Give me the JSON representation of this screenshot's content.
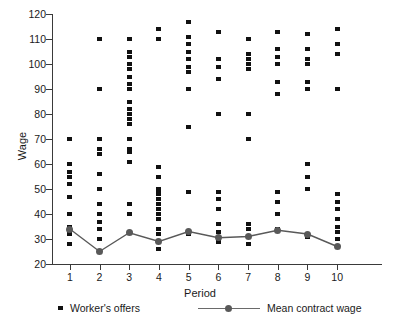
{
  "chart_data": {
    "type": "scatter",
    "title": "",
    "xlabel": "Period",
    "ylabel": "Wage",
    "xlim": [
      0.4,
      10.6
    ],
    "ylim": [
      20,
      120
    ],
    "grid": false,
    "x_ticks": [
      1,
      2,
      3,
      4,
      5,
      6,
      7,
      8,
      9,
      10
    ],
    "x_tick_labels": [
      "1",
      "2",
      "3",
      "4",
      "5",
      "6",
      "7",
      "8",
      "9",
      "10"
    ],
    "y_ticks": [
      20,
      30,
      40,
      50,
      60,
      70,
      80,
      90,
      100,
      110,
      120
    ],
    "y_tick_labels": [
      "20",
      "30",
      "40",
      "50",
      "60",
      "70",
      "80",
      "90",
      "100",
      "110",
      "120"
    ],
    "legend_position": "below",
    "series": [
      {
        "name": "Worker's offers",
        "type": "scatter",
        "marker": "square",
        "color": "#111111",
        "points": [
          {
            "x": 1,
            "y": 70
          },
          {
            "x": 1,
            "y": 60
          },
          {
            "x": 1,
            "y": 57
          },
          {
            "x": 1,
            "y": 55
          },
          {
            "x": 1,
            "y": 52
          },
          {
            "x": 1,
            "y": 47
          },
          {
            "x": 1,
            "y": 40
          },
          {
            "x": 1,
            "y": 35
          },
          {
            "x": 1,
            "y": 33
          },
          {
            "x": 1,
            "y": 32
          },
          {
            "x": 1,
            "y": 28
          },
          {
            "x": 2,
            "y": 110
          },
          {
            "x": 2,
            "y": 90
          },
          {
            "x": 2,
            "y": 70
          },
          {
            "x": 2,
            "y": 66
          },
          {
            "x": 2,
            "y": 64
          },
          {
            "x": 2,
            "y": 56
          },
          {
            "x": 2,
            "y": 50
          },
          {
            "x": 2,
            "y": 44
          },
          {
            "x": 2,
            "y": 40
          },
          {
            "x": 2,
            "y": 37
          },
          {
            "x": 2,
            "y": 34
          },
          {
            "x": 2,
            "y": 30
          },
          {
            "x": 2,
            "y": 25
          },
          {
            "x": 3,
            "y": 110
          },
          {
            "x": 3,
            "y": 105
          },
          {
            "x": 3,
            "y": 103
          },
          {
            "x": 3,
            "y": 100
          },
          {
            "x": 3,
            "y": 98
          },
          {
            "x": 3,
            "y": 95
          },
          {
            "x": 3,
            "y": 92
          },
          {
            "x": 3,
            "y": 90
          },
          {
            "x": 3,
            "y": 85
          },
          {
            "x": 3,
            "y": 82
          },
          {
            "x": 3,
            "y": 80
          },
          {
            "x": 3,
            "y": 78
          },
          {
            "x": 3,
            "y": 76
          },
          {
            "x": 3,
            "y": 70
          },
          {
            "x": 3,
            "y": 66
          },
          {
            "x": 3,
            "y": 65
          },
          {
            "x": 3,
            "y": 61
          },
          {
            "x": 3,
            "y": 44
          },
          {
            "x": 3,
            "y": 40
          },
          {
            "x": 3,
            "y": 33
          },
          {
            "x": 4,
            "y": 114
          },
          {
            "x": 4,
            "y": 110
          },
          {
            "x": 4,
            "y": 59
          },
          {
            "x": 4,
            "y": 55
          },
          {
            "x": 4,
            "y": 50
          },
          {
            "x": 4,
            "y": 49
          },
          {
            "x": 4,
            "y": 48
          },
          {
            "x": 4,
            "y": 46
          },
          {
            "x": 4,
            "y": 44
          },
          {
            "x": 4,
            "y": 42
          },
          {
            "x": 4,
            "y": 40
          },
          {
            "x": 4,
            "y": 38
          },
          {
            "x": 4,
            "y": 34
          },
          {
            "x": 4,
            "y": 32
          },
          {
            "x": 4,
            "y": 29
          },
          {
            "x": 4,
            "y": 26
          },
          {
            "x": 5,
            "y": 117
          },
          {
            "x": 5,
            "y": 111
          },
          {
            "x": 5,
            "y": 108
          },
          {
            "x": 5,
            "y": 105
          },
          {
            "x": 5,
            "y": 102
          },
          {
            "x": 5,
            "y": 99
          },
          {
            "x": 5,
            "y": 97
          },
          {
            "x": 5,
            "y": 90
          },
          {
            "x": 5,
            "y": 75
          },
          {
            "x": 5,
            "y": 49
          },
          {
            "x": 5,
            "y": 32
          },
          {
            "x": 6,
            "y": 113
          },
          {
            "x": 6,
            "y": 102
          },
          {
            "x": 6,
            "y": 99
          },
          {
            "x": 6,
            "y": 94
          },
          {
            "x": 6,
            "y": 80
          },
          {
            "x": 6,
            "y": 49
          },
          {
            "x": 6,
            "y": 46
          },
          {
            "x": 6,
            "y": 42
          },
          {
            "x": 6,
            "y": 36
          },
          {
            "x": 6,
            "y": 33
          },
          {
            "x": 6,
            "y": 29
          },
          {
            "x": 7,
            "y": 110
          },
          {
            "x": 7,
            "y": 104
          },
          {
            "x": 7,
            "y": 102
          },
          {
            "x": 7,
            "y": 100
          },
          {
            "x": 7,
            "y": 98
          },
          {
            "x": 7,
            "y": 80
          },
          {
            "x": 7,
            "y": 70
          },
          {
            "x": 7,
            "y": 36
          },
          {
            "x": 7,
            "y": 34
          },
          {
            "x": 7,
            "y": 31
          },
          {
            "x": 7,
            "y": 28
          },
          {
            "x": 8,
            "y": 113
          },
          {
            "x": 8,
            "y": 106
          },
          {
            "x": 8,
            "y": 103
          },
          {
            "x": 8,
            "y": 100
          },
          {
            "x": 8,
            "y": 93
          },
          {
            "x": 8,
            "y": 88
          },
          {
            "x": 8,
            "y": 49
          },
          {
            "x": 8,
            "y": 45
          },
          {
            "x": 8,
            "y": 40
          },
          {
            "x": 8,
            "y": 34
          },
          {
            "x": 9,
            "y": 112
          },
          {
            "x": 9,
            "y": 106
          },
          {
            "x": 9,
            "y": 102
          },
          {
            "x": 9,
            "y": 100
          },
          {
            "x": 9,
            "y": 93
          },
          {
            "x": 9,
            "y": 90
          },
          {
            "x": 9,
            "y": 60
          },
          {
            "x": 9,
            "y": 55
          },
          {
            "x": 9,
            "y": 50
          },
          {
            "x": 9,
            "y": 31
          },
          {
            "x": 10,
            "y": 114
          },
          {
            "x": 10,
            "y": 108
          },
          {
            "x": 10,
            "y": 104
          },
          {
            "x": 10,
            "y": 90
          },
          {
            "x": 10,
            "y": 48
          },
          {
            "x": 10,
            "y": 45
          },
          {
            "x": 10,
            "y": 42
          },
          {
            "x": 10,
            "y": 38
          },
          {
            "x": 10,
            "y": 35
          },
          {
            "x": 10,
            "y": 33
          },
          {
            "x": 10,
            "y": 30
          },
          {
            "x": 10,
            "y": 27
          }
        ]
      },
      {
        "name": "Mean contract wage",
        "type": "line",
        "marker": "circle",
        "color": "#595959",
        "x": [
          1,
          2,
          3,
          4,
          5,
          6,
          7,
          8,
          9,
          10
        ],
        "values": [
          34,
          25,
          32.5,
          29,
          33,
          30.5,
          31,
          33.5,
          32,
          27
        ]
      }
    ]
  },
  "legend": {
    "items": [
      {
        "label": "Worker's offers",
        "marker": "square"
      },
      {
        "label": "Mean contract wage",
        "marker": "line-circle"
      }
    ]
  }
}
